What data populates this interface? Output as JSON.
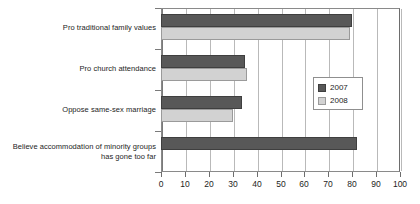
{
  "chart_data": {
    "type": "bar",
    "orientation": "horizontal",
    "title": "",
    "subtitle": "",
    "xlabel": "",
    "ylabel": "",
    "xlim": [
      0,
      100
    ],
    "xticks": [
      0,
      10,
      20,
      30,
      40,
      50,
      60,
      70,
      80,
      90,
      100
    ],
    "xtick_labels": [
      "0",
      "10",
      "20",
      "30",
      "40",
      "50",
      "60",
      "70",
      "80",
      "90",
      "100"
    ],
    "grid": "vertical",
    "legend_position": "center-right-inside",
    "categories": [
      "Pro traditional family values",
      "Pro church attendance",
      "Oppose same-sex marriage",
      "Believe accommodation of minority groups\nhas gone too far"
    ],
    "series": [
      {
        "name": "2007",
        "color": "#585858",
        "values": [
          80,
          35,
          34,
          82
        ]
      },
      {
        "name": "2008",
        "color": "#d2d2d2",
        "values": [
          79,
          36,
          30,
          null
        ]
      }
    ],
    "legend": [
      {
        "label": "2007",
        "color": "#585858"
      },
      {
        "label": "2008",
        "color": "#d2d2d2"
      }
    ],
    "colors": {
      "series_2007": "#585858",
      "series_2008": "#d2d2d2",
      "gridline": "#b9b9b9",
      "axis": "#7a7a7a",
      "background": "#ffffff",
      "text": "#1d1d1d"
    }
  }
}
